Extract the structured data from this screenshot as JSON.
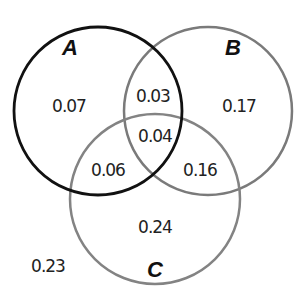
{
  "diagram": {
    "type": "venn",
    "sets": [
      {
        "name": "A",
        "color": "#111111"
      },
      {
        "name": "B",
        "color": "#777777"
      },
      {
        "name": "C",
        "color": "#808080"
      }
    ],
    "regions": {
      "A_only": "0.07",
      "B_only": "0.17",
      "C_only": "0.24",
      "AB_only": "0.03",
      "AC_only": "0.06",
      "BC_only": "0.16",
      "ABC": "0.04",
      "outside": "0.23"
    }
  }
}
